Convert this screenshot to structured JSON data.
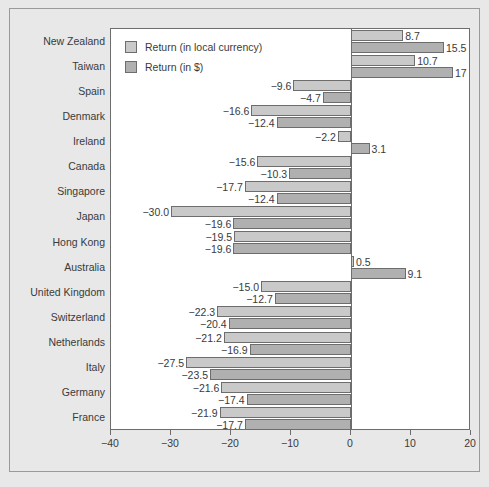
{
  "chart_data": {
    "type": "bar",
    "orientation": "horizontal",
    "title": "",
    "xlabel": "",
    "ylabel": "",
    "xlim": [
      -40,
      20
    ],
    "xticks": [
      -40,
      -30,
      -20,
      -10,
      0,
      10,
      20
    ],
    "xtick_labels": [
      "−40",
      "−30",
      "−20",
      "−10",
      "0",
      "10",
      "20"
    ],
    "grid": false,
    "legend_position": "upper left",
    "categories": [
      "New Zealand",
      "Taiwan",
      "Spain",
      "Denmark",
      "Ireland",
      "Canada",
      "Singapore",
      "Japan",
      "Hong Kong",
      "Australia",
      "United Kingdom",
      "Switzerland",
      "Netherlands",
      "Italy",
      "Germany",
      "France"
    ],
    "series": [
      {
        "name": "Return (in local currency)",
        "color": "#c9c9c9",
        "values": [
          8.7,
          10.7,
          -9.6,
          -16.6,
          -2.2,
          -15.6,
          -17.7,
          -30.0,
          -19.5,
          0.5,
          -15.0,
          -22.3,
          -21.2,
          -27.5,
          -21.6,
          -21.9
        ],
        "labels": [
          "8.7",
          "10.7",
          "−9.6",
          "−16.6",
          "−2.2",
          "−15.6",
          "−17.7",
          "−30.0",
          "−19.5",
          "0.5",
          "−15.0",
          "−22.3",
          "−21.2",
          "−27.5",
          "−21.6",
          "−21.9"
        ]
      },
      {
        "name": "Return (in $)",
        "color": "#b0b0b0",
        "values": [
          15.5,
          17.0,
          -4.7,
          -12.4,
          3.1,
          -10.3,
          -12.4,
          -19.6,
          -19.6,
          9.1,
          -12.7,
          -20.4,
          -16.9,
          -23.5,
          -17.4,
          -17.7
        ],
        "labels": [
          "15.5",
          "17",
          "−4.7",
          "−12.4",
          "3.1",
          "−10.3",
          "−12.4",
          "−19.6",
          "−19.6",
          "9.1",
          "−12.7",
          "−20.4",
          "−16.9",
          "−23.5",
          "−17.4",
          "−17.7"
        ]
      }
    ]
  },
  "legend": {
    "items": [
      {
        "label": "Return (in local currency)",
        "swatch_class": "series-local"
      },
      {
        "label": "Return (in $)",
        "swatch_class": "series-usd"
      }
    ]
  },
  "colors": {
    "figure_background": "#e8e8e8",
    "plot_background": "#ffffff",
    "axis": "#6d6d6d",
    "text": "#3a3a3a",
    "series_local": "#c9c9c9",
    "series_usd": "#b0b0b0"
  }
}
